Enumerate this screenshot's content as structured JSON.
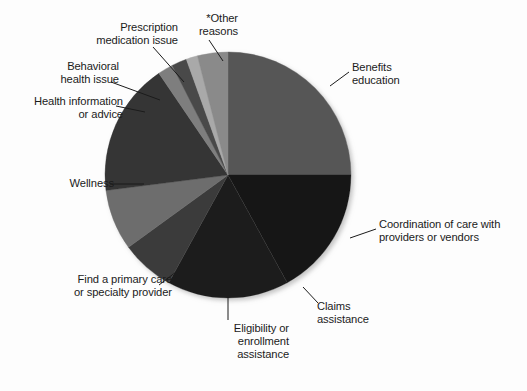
{
  "chart_data": {
    "type": "pie",
    "title": "",
    "subtitle": "",
    "xlabel": "",
    "ylabel": "",
    "legend_position": "callout-labels",
    "grid": false,
    "note": "*Other reasons",
    "start_angle_deg": 0,
    "direction": "clockwise",
    "categories": [
      "Benefits education",
      "Coordination of care with providers or vendors",
      "Claims assistance",
      "Eligibility or enrollment assistance",
      "Find a primary care or specialty provider",
      "Wellness",
      "Health information or advice",
      "Behavioral health issue",
      "Prescription medication issue",
      "*Other reasons"
    ],
    "values": [
      25,
      17,
      16,
      7,
      8,
      17.5,
      2,
      2,
      1.5,
      4
    ],
    "slices": [
      {
        "label": "Benefits education",
        "value": 25,
        "start_deg": 0,
        "end_deg": 90,
        "color": "#575757"
      },
      {
        "label": "Coordination of care with providers or vendors",
        "value": 17,
        "start_deg": 90,
        "end_deg": 151.2,
        "color": "#141414"
      },
      {
        "label": "Claims assistance",
        "value": 16,
        "start_deg": 151.2,
        "end_deg": 208.8,
        "color": "#1d1d1d"
      },
      {
        "label": "Eligibility or enrollment assistance",
        "value": 7,
        "start_deg": 208.8,
        "end_deg": 234,
        "color": "#3b3b3b"
      },
      {
        "label": "Find a primary care or specialty provider",
        "value": 8,
        "start_deg": 234,
        "end_deg": 262.8,
        "color": "#6d6d6d"
      },
      {
        "label": "Wellness",
        "value": 17.5,
        "start_deg": 262.8,
        "end_deg": 325.8,
        "color": "#343434"
      },
      {
        "label": "Health information or advice",
        "value": 2,
        "start_deg": 325.8,
        "end_deg": 333,
        "color": "#7e7e7e"
      },
      {
        "label": "Behavioral health issue",
        "value": 2,
        "start_deg": 333,
        "end_deg": 340.2,
        "color": "#4a4a4a"
      },
      {
        "label": "Prescription medication issue",
        "value": 1.5,
        "start_deg": 340.2,
        "end_deg": 345.6,
        "color": "#a9a9a9"
      },
      {
        "label": "*Other reasons",
        "value": 4,
        "start_deg": 345.6,
        "end_deg": 360,
        "color": "#8a8a8a"
      }
    ]
  },
  "labels": {
    "benefits": "Benefits\neducation",
    "coordination": "Coordination of care with\nproviders or vendors",
    "claims": "Claims\nassistance",
    "eligibility": "Eligibility or\nenrollment\nassistance",
    "findprovider": "Find a primary care\nor specialty provider",
    "wellness": "Wellness",
    "healthinfo": "Health information\nor advice",
    "behavioral": "Behavioral\nhealth issue",
    "prescription": "Prescription\nmedication issue",
    "other": "*Other\nreasons"
  },
  "colors": {
    "background": "#fdfdfd",
    "text": "#1b1b1b",
    "leader_line": "#1b1b1b"
  }
}
